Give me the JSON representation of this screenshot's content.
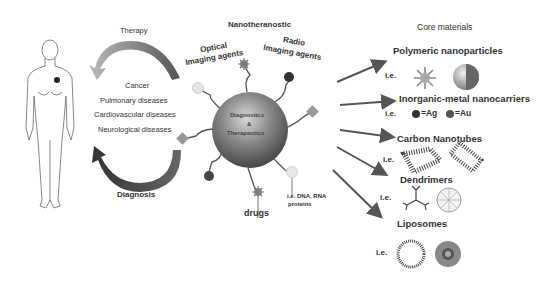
{
  "left": {
    "therapy_label": "Therapy",
    "diagnosis_label": "Diagnosis",
    "diseases": [
      "Cancer",
      "Pulmonary diseases",
      "Cardiovascular diseases",
      "Neurological diseases"
    ]
  },
  "center": {
    "title": "Nanotheranostic",
    "sphere_label_1": "Diagnostics",
    "sphere_label_2": "&",
    "sphere_label_3": "Therapeutics",
    "optical_label_1": "Optical",
    "optical_label_2": "Imaging agents",
    "radio_label_1": "Radio",
    "radio_label_2": "Imaging agents",
    "drugs_label": "drugs",
    "biomolecules_label_1": "i.e. DNA, RNA",
    "biomolecules_label_2": "proteins"
  },
  "right": {
    "title": "Core materials",
    "categories": [
      {
        "name": "Polymeric nanoparticles",
        "example_prefix": "i.e."
      },
      {
        "name": "Inorganic-metal nanocarriers",
        "example_prefix": "i.e.",
        "ag_label": "=Ag",
        "au_label": "=Au"
      },
      {
        "name": "Carbon Nanotubes",
        "example_prefix": "i.e."
      },
      {
        "name": "Dendrimers",
        "example_prefix": "i.e."
      },
      {
        "name": "Liposomes",
        "example_prefix": "i.e."
      }
    ]
  },
  "colors": {
    "arrow": "#555555",
    "cycle_arrow": "#4a4a4a",
    "sphere": "#6a6a6a",
    "text": "#333333"
  }
}
